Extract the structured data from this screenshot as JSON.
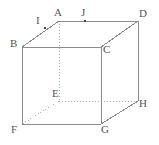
{
  "figure": {
    "type": "geometric-solid",
    "shape": "cube",
    "canvas": {
      "width": 159,
      "height": 145,
      "background": "#ffffff"
    },
    "style": {
      "solid_edge_color": "#8c8c8c",
      "hidden_edge_color": "#b0b0b0",
      "label_color": "#555555",
      "point_color": "#444444",
      "solid_edge_width": 1,
      "hidden_edge_width": 1,
      "hidden_edge_dash": "1,2"
    },
    "vertices": [
      {
        "name": "A",
        "x": 59,
        "y": 21,
        "label_x": 54,
        "label_y": 7,
        "hidden": false
      },
      {
        "name": "B",
        "x": 22,
        "y": 47,
        "label_x": 10,
        "label_y": 38,
        "hidden": false
      },
      {
        "name": "C",
        "x": 101,
        "y": 47,
        "label_x": 103,
        "label_y": 44,
        "hidden": false
      },
      {
        "name": "D",
        "x": 138,
        "y": 21,
        "label_x": 139,
        "label_y": 8,
        "hidden": false
      },
      {
        "name": "E",
        "x": 59,
        "y": 101,
        "label_x": 52,
        "label_y": 88,
        "hidden": true
      },
      {
        "name": "F",
        "x": 22,
        "y": 124,
        "label_x": 11,
        "label_y": 124,
        "hidden": false
      },
      {
        "name": "G",
        "x": 101,
        "y": 124,
        "label_x": 101,
        "label_y": 124,
        "hidden": false
      },
      {
        "name": "H",
        "x": 138,
        "y": 101,
        "label_x": 139,
        "label_y": 98,
        "hidden": false
      }
    ],
    "marked_points": [
      {
        "name": "I",
        "x": 45,
        "y": 28,
        "label_x": 36,
        "label_y": 15,
        "on_edge": "B-A"
      },
      {
        "name": "J",
        "x": 85,
        "y": 21,
        "label_x": 81,
        "label_y": 7,
        "on_edge": "A-D"
      }
    ],
    "solid_edges": [
      {
        "from": "A",
        "to": "B"
      },
      {
        "from": "A",
        "to": "D"
      },
      {
        "from": "B",
        "to": "C"
      },
      {
        "from": "C",
        "to": "D"
      },
      {
        "from": "B",
        "to": "F"
      },
      {
        "from": "C",
        "to": "G"
      },
      {
        "from": "D",
        "to": "H"
      },
      {
        "from": "F",
        "to": "G"
      },
      {
        "from": "G",
        "to": "H"
      }
    ],
    "hidden_edges": [
      {
        "from": "A",
        "to": "E"
      },
      {
        "from": "E",
        "to": "F"
      },
      {
        "from": "E",
        "to": "H"
      }
    ]
  }
}
